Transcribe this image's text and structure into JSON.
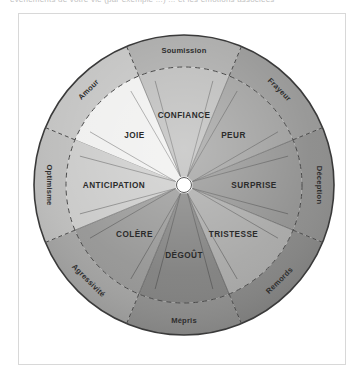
{
  "caption_fragment": "événements de votre vie (par exemple ...) ... et les émotions associées",
  "figure": {
    "center_hub": "",
    "primary_emotions": [
      {
        "label": "JOIE",
        "color": "#efefee",
        "text_color": "#2b2b2b"
      },
      {
        "label": "CONFIANCE",
        "color": "#b9b9b8",
        "text_color": "#2b2b2b"
      },
      {
        "label": "PEUR",
        "color": "#9b9b9a",
        "text_color": "#2b2b2b"
      },
      {
        "label": "SURPRISE",
        "color": "#8e8e8d",
        "text_color": "#2b2b2b"
      },
      {
        "label": "TRISTESSE",
        "color": "#a6a6a5",
        "text_color": "#2b2b2b"
      },
      {
        "label": "DÉGOÛT",
        "color": "#7e7e7d",
        "text_color": "#2b2b2b"
      },
      {
        "label": "COLÈRE",
        "color": "#949493",
        "text_color": "#2b2b2b"
      },
      {
        "label": "ANTICIPATION",
        "color": "#c9c9c8",
        "text_color": "#2b2b2b"
      }
    ],
    "dyads": [
      {
        "label": "Amour",
        "color": "#c2c2c1"
      },
      {
        "label": "Soumission",
        "color": "#a8a8a7"
      },
      {
        "label": "Frayeur",
        "color": "#949493"
      },
      {
        "label": "Déception",
        "color": "#8a8a89"
      },
      {
        "label": "Remords",
        "color": "#838382"
      },
      {
        "label": "Mépris",
        "color": "#8c8c8b"
      },
      {
        "label": "Agressivité",
        "color": "#a2a2a1"
      },
      {
        "label": "Optimisme",
        "color": "#bcbcbb"
      }
    ],
    "colors": {
      "frame_border": "#d8d8d8",
      "outline": "#3a3a3a",
      "dashed_guide": "#4a4a4a",
      "hub_fill": "#ffffff",
      "page_background": "#ffffff"
    }
  }
}
